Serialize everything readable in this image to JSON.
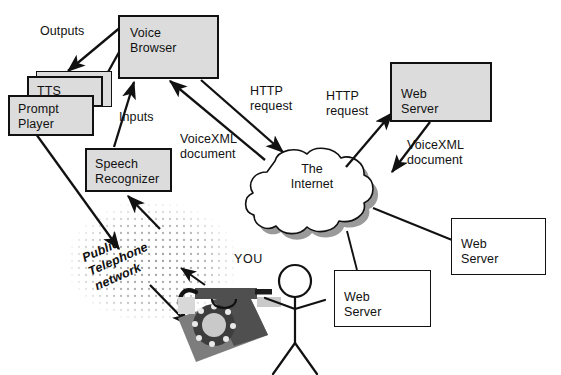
{
  "diagram": {
    "colors": {
      "shaded_fill": "#dcdcdc",
      "plain_fill": "#ffffff",
      "stroke": "#111111",
      "cloud_shadow": "#9a9a9a",
      "phone_dark": "#4f4f4f",
      "phone_mid": "#7d7d7d",
      "phone_light": "#b9b9b9",
      "dot_color": "#9b9b9b"
    },
    "nodes": {
      "voice_browser": "Voice\nBrowser",
      "tts": "TTS",
      "prompt_player": "Prompt\nPlayer",
      "speech_recognizer": "Speech\nRecognizer",
      "web_server_top": "Web\nServer",
      "web_server_right": "Web\nServer",
      "web_server_bottom": "Web\nServer",
      "internet_cloud": "The\nInternet",
      "public_telephone_network": "Public\nTelephone\nnetwork"
    },
    "edge_labels": {
      "outputs": "Outputs",
      "inputs": "Inputs",
      "http_request_left": "HTTP\nrequest",
      "http_request_right": "HTTP\nrequest",
      "voicexml_document_left": "VoiceXML\ndocument",
      "voicexml_document_right": "VoiceXML\ndocument"
    },
    "actor": {
      "you": "YOU"
    }
  }
}
